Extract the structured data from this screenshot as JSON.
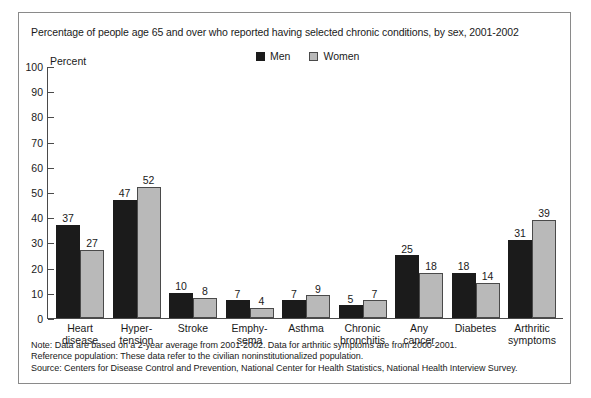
{
  "chart_data": {
    "type": "bar",
    "title": "Percentage of people age 65 and over who reported having selected chronic conditions, by sex, 2001-2002",
    "xlabel": "",
    "ylabel": "Percent",
    "ylim": [
      0,
      100
    ],
    "ytick_step": 10,
    "yticks": [
      100,
      90,
      80,
      70,
      60,
      50,
      40,
      30,
      20,
      10,
      0
    ],
    "grid": false,
    "legend_position": "top-center",
    "categories": [
      "Heart\ndisease",
      "Hyper-\ntension",
      "Stroke",
      "Emphy-\nsema",
      "Asthma",
      "Chronic\nbronchitis",
      "Any\ncancer",
      "Diabetes",
      "Arthritic\nsymptoms"
    ],
    "category_lines": [
      [
        "Heart",
        "disease"
      ],
      [
        "Hyper-",
        "tension"
      ],
      [
        "Stroke",
        ""
      ],
      [
        "Emphy-",
        "sema"
      ],
      [
        "Asthma",
        ""
      ],
      [
        "Chronic",
        "bronchitis"
      ],
      [
        "Any",
        "cancer"
      ],
      [
        "Diabetes",
        ""
      ],
      [
        "Arthritic",
        "symptoms"
      ]
    ],
    "series": [
      {
        "name": "Men",
        "color": "#1b1b1b",
        "values": [
          37,
          47,
          10,
          7,
          7,
          5,
          25,
          18,
          31
        ]
      },
      {
        "name": "Women",
        "color": "#b9b9b9",
        "values": [
          27,
          52,
          8,
          4,
          9,
          7,
          18,
          14,
          39
        ]
      }
    ]
  },
  "legend": {
    "items": [
      {
        "label": "Men"
      },
      {
        "label": "Women"
      }
    ]
  },
  "axis": {
    "y_axis_title": "Percent"
  },
  "footnotes": {
    "note": "Note: Data are based on a 2-year average from 2001-2002. Data for arthritic symptoms are from 2000-2001.",
    "reference_population": "Reference population: These data refer to the civilian noninstitutionalized population.",
    "source": "Source: Centers for Disease Control and Prevention, National Center for Health Statistics, National Health Interview Survey."
  }
}
